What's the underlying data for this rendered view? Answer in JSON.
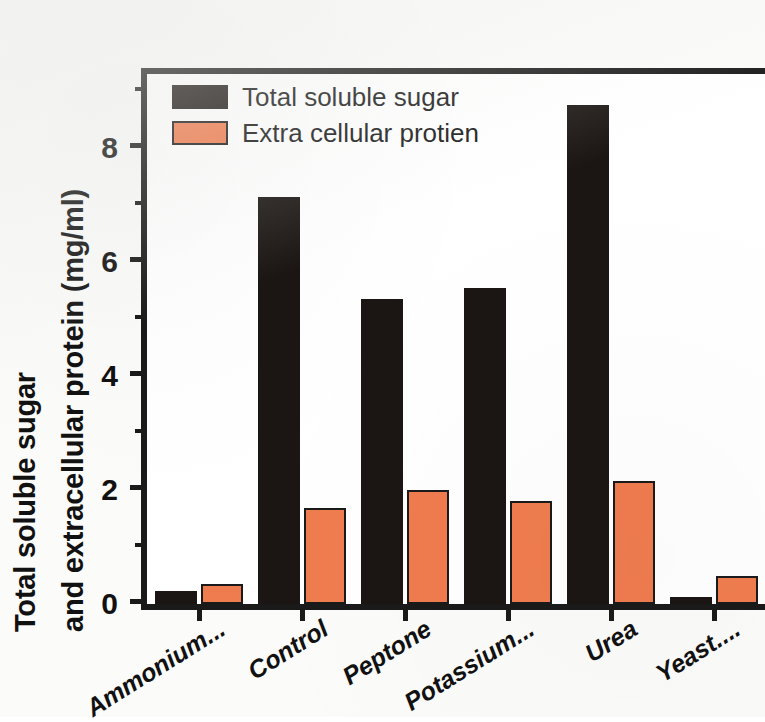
{
  "chart_data": {
    "type": "bar",
    "title": "",
    "subtitle": "",
    "xlabel": "",
    "ylabel": "Total soluble sugar and extracellular protein (mg/ml)",
    "ylabel_lines": [
      "Total soluble sugar",
      "and extracellular protein (mg/ml)"
    ],
    "categories": [
      "Ammonium...",
      "Control",
      "Peptone",
      "Potassium...",
      "Urea",
      "Yeast...."
    ],
    "series": [
      {
        "name": "Total soluble sugar",
        "color": "#1b1613",
        "values": [
          0.23,
          7.15,
          5.35,
          5.55,
          8.75,
          0.12
        ]
      },
      {
        "name": "Extra cellular protien",
        "color": "#ef7c4f",
        "values": [
          0.35,
          1.68,
          2.0,
          1.8,
          2.15,
          0.5
        ]
      }
    ],
    "ylim": [
      0,
      9.3
    ],
    "yticks_major": [
      0,
      2,
      4,
      6,
      8
    ],
    "yticks_major_labels": [
      "0",
      "2",
      "4",
      "6",
      "8"
    ],
    "yticks_minor": [
      1,
      3,
      5,
      7,
      9
    ],
    "grid": false,
    "legend_position": "top-left",
    "axis_color": "#1a1a1a",
    "background": "#ffffff"
  },
  "legend": {
    "entries": [
      {
        "label": "Total soluble sugar",
        "color": "#1b1613"
      },
      {
        "label": "Extra cellular protien",
        "color": "#ef7c4f"
      }
    ]
  }
}
